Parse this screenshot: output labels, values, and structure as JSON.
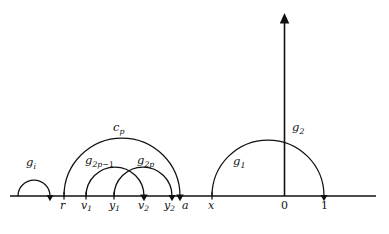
{
  "figure": {
    "type": "mathematical-diagram",
    "background_color": "#ffffff",
    "stroke_color": "#111111",
    "baseline_y": 196,
    "axis": {
      "real_line": {
        "x_start": 10,
        "x_end": 376,
        "y": 196
      },
      "vertical_axis": {
        "x": 284,
        "y_top": 14,
        "y_bottom": 196,
        "has_arrow_head": true
      }
    },
    "tick_labels": [
      {
        "id": "r",
        "text": "r",
        "sub": "",
        "x": 62,
        "y": 200
      },
      {
        "id": "v1",
        "text": "v",
        "sub": "1",
        "x": 84,
        "y": 200
      },
      {
        "id": "y1",
        "text": "y",
        "sub": "1",
        "x": 112,
        "y": 200
      },
      {
        "id": "v2",
        "text": "v",
        "sub": "2",
        "x": 140,
        "y": 200
      },
      {
        "id": "y2",
        "text": "y",
        "sub": "2",
        "x": 166,
        "y": 200
      },
      {
        "id": "a",
        "text": "a",
        "sub": "",
        "x": 184,
        "y": 200
      },
      {
        "id": "x",
        "text": "x",
        "sub": "",
        "x": 209,
        "y": 200
      },
      {
        "id": "0",
        "text": "0",
        "sub": "",
        "x": 281,
        "y": 200
      },
      {
        "id": "1",
        "text": "1",
        "sub": "",
        "x": 321,
        "y": 200
      }
    ],
    "curve_labels": [
      {
        "id": "gi",
        "text": "g",
        "sub": "i",
        "sub_op": "",
        "x": 26,
        "y": 157
      },
      {
        "id": "cp",
        "text": "c",
        "sub": "p",
        "sub_op": "",
        "x": 113,
        "y": 122
      },
      {
        "id": "g2p-1",
        "text": "g",
        "sub": "2p",
        "sub_op": "−1",
        "x": 85,
        "y": 155
      },
      {
        "id": "g2p",
        "text": "g",
        "sub": "2p",
        "sub_op": "",
        "x": 137,
        "y": 155
      },
      {
        "id": "g1",
        "text": "g",
        "sub": "1",
        "sub_op": "",
        "x": 233,
        "y": 156
      },
      {
        "id": "g2",
        "text": "g",
        "sub": "2",
        "sub_op": "",
        "x": 292,
        "y": 122
      }
    ],
    "arcs": [
      {
        "id": "arc-gi",
        "x_left": 18,
        "x_right": 50,
        "arrow_at": "right",
        "label": "gi"
      },
      {
        "id": "arc-cp",
        "x_left": 64,
        "x_right": 180,
        "arrow_at": "right",
        "label": "cp"
      },
      {
        "id": "arc-g2p-1",
        "x_left": 86,
        "x_right": 144,
        "arrow_at": "right",
        "label": "g2p-1"
      },
      {
        "id": "arc-g2p",
        "x_left": 114,
        "x_right": 172,
        "arrow_at": "right",
        "label": "g2p"
      },
      {
        "id": "arc-g1",
        "x_left": 212,
        "x_right": 324,
        "arrow_at": "right",
        "label": "g1"
      }
    ],
    "tick_marks": [
      {
        "id": "tick-r",
        "x": 64
      },
      {
        "id": "tick-v1",
        "x": 86
      },
      {
        "id": "tick-y1",
        "x": 114
      },
      {
        "id": "tick-v2",
        "x": 144
      },
      {
        "id": "tick-y2",
        "x": 172
      },
      {
        "id": "tick-a",
        "x": 180
      },
      {
        "id": "tick-x",
        "x": 212
      },
      {
        "id": "tick-1",
        "x": 324
      }
    ]
  }
}
